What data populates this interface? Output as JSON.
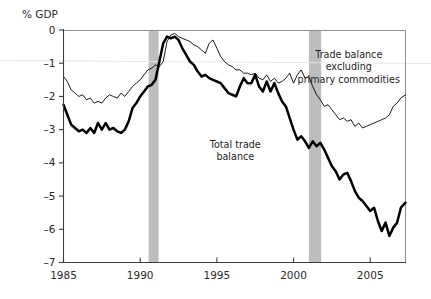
{
  "chart_data": {
    "type": "line",
    "title": "",
    "subtitle": "",
    "ylabel": "% GDP",
    "xlabel": "",
    "xlim": [
      1985.0,
      2007.3
    ],
    "ylim": [
      -7,
      0
    ],
    "grid": false,
    "legend_position": "inline-annotations",
    "x_ticks": [
      1985,
      1990,
      1995,
      2000,
      2005
    ],
    "x_tick_labels": [
      "1985",
      "1990",
      "1995",
      "2000",
      "2005"
    ],
    "y_ticks": [
      0,
      -1,
      -2,
      -3,
      -4,
      -5,
      -6,
      -7
    ],
    "y_tick_labels": [
      "0",
      "–1",
      "–2",
      "–3",
      "–4",
      "–5",
      "–6",
      "–7"
    ],
    "annotations": [
      {
        "name": "trade-balance-ex-primary-label",
        "lines": [
          "Trade balance",
          "excluding",
          "primary commodities"
        ],
        "x": 2003.6,
        "y": -0.85
      },
      {
        "name": "total-trade-balance-label",
        "lines": [
          "Total trade",
          "balance"
        ],
        "x": 1996.2,
        "y": -3.55
      }
    ],
    "shaded_regions": [
      {
        "name": "recession-1990-1991",
        "x0": 1990.55,
        "x1": 1991.2,
        "color": "#bdbdbd"
      },
      {
        "name": "recession-2001",
        "x0": 2001.0,
        "x1": 2001.8,
        "color": "#bdbdbd"
      }
    ],
    "series": [
      {
        "name": "Total trade balance",
        "style": "thick",
        "color": "#000000",
        "x": [
          1985.0,
          1985.25,
          1985.5,
          1985.75,
          1986.0,
          1986.25,
          1986.5,
          1986.75,
          1987.0,
          1987.25,
          1987.5,
          1987.75,
          1988.0,
          1988.25,
          1988.5,
          1988.75,
          1989.0,
          1989.25,
          1989.5,
          1989.75,
          1990.0,
          1990.25,
          1990.5,
          1990.75,
          1991.0,
          1991.25,
          1991.5,
          1991.75,
          1992.0,
          1992.25,
          1992.5,
          1992.75,
          1993.0,
          1993.25,
          1993.5,
          1993.75,
          1994.0,
          1994.25,
          1994.5,
          1994.75,
          1995.0,
          1995.25,
          1995.5,
          1995.75,
          1996.0,
          1996.25,
          1996.5,
          1996.75,
          1997.0,
          1997.25,
          1997.5,
          1997.75,
          1998.0,
          1998.25,
          1998.5,
          1998.75,
          1999.0,
          1999.25,
          1999.5,
          1999.75,
          2000.0,
          2000.25,
          2000.5,
          2000.75,
          2001.0,
          2001.25,
          2001.5,
          2001.75,
          2002.0,
          2002.25,
          2002.5,
          2002.75,
          2003.0,
          2003.25,
          2003.5,
          2003.75,
          2004.0,
          2004.25,
          2004.5,
          2004.75,
          2005.0,
          2005.25,
          2005.5,
          2005.75,
          2006.0,
          2006.25,
          2006.5,
          2006.75,
          2007.0,
          2007.3
        ],
        "y": [
          -2.25,
          -2.55,
          -2.85,
          -2.95,
          -3.05,
          -3.0,
          -3.1,
          -2.95,
          -3.1,
          -2.8,
          -3.0,
          -2.8,
          -3.0,
          -2.95,
          -3.05,
          -3.1,
          -3.0,
          -2.75,
          -2.35,
          -2.2,
          -2.0,
          -1.85,
          -1.7,
          -1.65,
          -1.5,
          -0.95,
          -0.4,
          -0.2,
          -0.25,
          -0.2,
          -0.3,
          -0.55,
          -0.75,
          -0.95,
          -1.05,
          -1.25,
          -1.4,
          -1.35,
          -1.45,
          -1.5,
          -1.55,
          -1.6,
          -1.75,
          -1.9,
          -1.95,
          -2.0,
          -1.7,
          -1.45,
          -1.6,
          -1.6,
          -1.35,
          -1.7,
          -1.85,
          -1.55,
          -1.85,
          -1.6,
          -1.9,
          -2.15,
          -2.3,
          -2.65,
          -3.0,
          -3.3,
          -3.2,
          -3.35,
          -3.55,
          -3.35,
          -3.5,
          -3.4,
          -3.6,
          -3.85,
          -4.1,
          -4.25,
          -4.5,
          -4.35,
          -4.3,
          -4.55,
          -4.85,
          -5.05,
          -5.15,
          -5.3,
          -5.45,
          -5.35,
          -5.75,
          -6.05,
          -5.8,
          -6.2,
          -5.95,
          -5.8,
          -5.35,
          -5.2
        ]
      },
      {
        "name": "Trade balance excluding primary commodities",
        "style": "thin",
        "color": "#000000",
        "x": [
          1985.0,
          1985.25,
          1985.5,
          1985.75,
          1986.0,
          1986.25,
          1986.5,
          1986.75,
          1987.0,
          1987.25,
          1987.5,
          1987.75,
          1988.0,
          1988.25,
          1988.5,
          1988.75,
          1989.0,
          1989.25,
          1989.5,
          1989.75,
          1990.0,
          1990.25,
          1990.5,
          1990.75,
          1991.0,
          1991.25,
          1991.5,
          1991.75,
          1992.0,
          1992.25,
          1992.5,
          1992.75,
          1993.0,
          1993.25,
          1993.5,
          1993.75,
          1994.0,
          1994.25,
          1994.5,
          1994.75,
          1995.0,
          1995.25,
          1995.5,
          1995.75,
          1996.0,
          1996.25,
          1996.5,
          1996.75,
          1997.0,
          1997.25,
          1997.5,
          1997.75,
          1998.0,
          1998.25,
          1998.5,
          1998.75,
          1999.0,
          1999.25,
          1999.5,
          1999.75,
          2000.0,
          2000.25,
          2000.5,
          2000.75,
          2001.0,
          2001.25,
          2001.5,
          2001.75,
          2002.0,
          2002.25,
          2002.5,
          2002.75,
          2003.0,
          2003.25,
          2003.5,
          2003.75,
          2004.0,
          2004.25,
          2004.5,
          2004.75,
          2005.0,
          2005.25,
          2005.5,
          2005.75,
          2006.0,
          2006.25,
          2006.5,
          2006.75,
          2007.0,
          2007.3
        ],
        "y": [
          -1.4,
          -1.55,
          -1.8,
          -1.9,
          -2.0,
          -1.95,
          -2.1,
          -2.05,
          -2.2,
          -2.15,
          -2.2,
          -2.05,
          -1.95,
          -2.0,
          -2.05,
          -1.9,
          -2.0,
          -1.85,
          -1.7,
          -1.6,
          -1.5,
          -1.35,
          -1.2,
          -1.15,
          -1.05,
          -1.1,
          -0.95,
          -0.35,
          -0.15,
          -0.1,
          -0.2,
          -0.25,
          -0.3,
          -0.35,
          -0.45,
          -0.5,
          -0.6,
          -0.7,
          -0.4,
          -0.3,
          -0.55,
          -0.8,
          -0.95,
          -1.05,
          -1.1,
          -1.2,
          -1.2,
          -1.3,
          -1.3,
          -1.35,
          -1.3,
          -1.45,
          -1.5,
          -1.35,
          -1.55,
          -1.45,
          -1.6,
          -1.55,
          -1.45,
          -1.3,
          -1.6,
          -1.35,
          -1.2,
          -1.45,
          -1.4,
          -1.7,
          -1.95,
          -2.1,
          -2.3,
          -2.25,
          -2.4,
          -2.55,
          -2.7,
          -2.65,
          -2.75,
          -2.7,
          -2.9,
          -2.8,
          -2.95,
          -2.9,
          -2.85,
          -2.8,
          -2.75,
          -2.7,
          -2.65,
          -2.55,
          -2.3,
          -2.2,
          -2.05,
          -1.95
        ]
      }
    ]
  }
}
